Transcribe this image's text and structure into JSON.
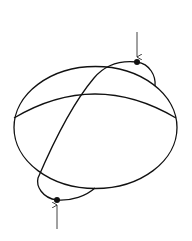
{
  "diagram": {
    "stroke_color": "#111111",
    "background": "#ffffff",
    "main_ellipse": {
      "cx": 95.5,
      "cy": 127.5,
      "rx": 81.5,
      "ry": 61
    },
    "inner_arc": {
      "start": [
        14,
        118
      ],
      "control": [
        95,
        68
      ],
      "end": [
        176,
        118
      ]
    },
    "tilted_circle": {
      "points_of_note": {
        "top_pole": [
          137,
          62
        ],
        "bottom_pole": [
          57,
          200
        ]
      }
    },
    "markers": [
      {
        "name": "top-pole",
        "x": 137,
        "y": 62,
        "arrow_from": [
          137,
          32
        ],
        "arrow_to": [
          137,
          57
        ]
      },
      {
        "name": "bottom-pole",
        "x": 57,
        "y": 200,
        "arrow_from": [
          57,
          229
        ],
        "arrow_to": [
          57,
          205
        ]
      }
    ]
  }
}
